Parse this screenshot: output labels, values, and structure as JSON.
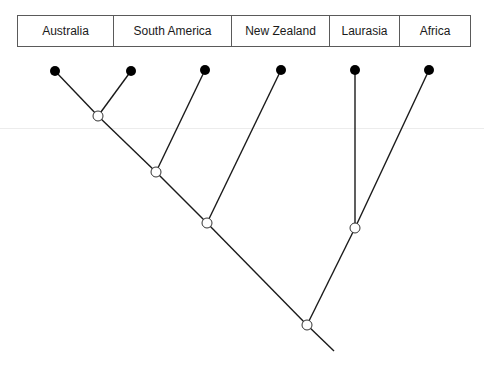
{
  "diagram": {
    "type": "cladogram",
    "taxa": [
      {
        "label": "Australia",
        "width": 96
      },
      {
        "label": "South America",
        "width": 118
      },
      {
        "label": "New Zealand",
        "width": 98
      },
      {
        "label": "Laurasia",
        "width": 70
      },
      {
        "label": "Africa",
        "width": 70
      }
    ],
    "colors": {
      "line": "#1a1a1a",
      "leaf_fill": "#000000",
      "node_fill": "#ffffff",
      "border": "#5a5a5a"
    },
    "leaves": [
      {
        "taxon": "Australia",
        "x": 55,
        "y": 71
      },
      {
        "taxon": "South America",
        "x": 131,
        "y": 71
      },
      {
        "taxon": "New Zealand",
        "x": 205,
        "y": 70
      },
      {
        "taxon": "Laurasia",
        "x": 281,
        "y": 70
      },
      {
        "taxon": "Africa",
        "x": 355,
        "y": 70
      },
      {
        "taxon": "extra",
        "x": 429,
        "y": 70
      }
    ],
    "internal_nodes": [
      {
        "id": "n1",
        "x": 98,
        "y": 116
      },
      {
        "id": "n2",
        "x": 156,
        "y": 172
      },
      {
        "id": "n3",
        "x": 207,
        "y": 223
      },
      {
        "id": "n4",
        "x": 355,
        "y": 228
      },
      {
        "id": "root",
        "x": 307,
        "y": 325
      }
    ],
    "root_stem_end": {
      "x": 334,
      "y": 351
    }
  }
}
